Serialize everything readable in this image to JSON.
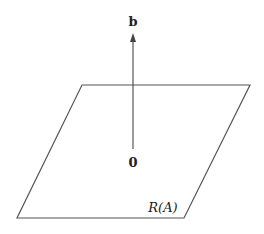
{
  "diagram": {
    "plane_label": "R(A)",
    "vector_label": "b",
    "origin_label": "0",
    "line_color": "#555555",
    "text_color": "#222222"
  }
}
